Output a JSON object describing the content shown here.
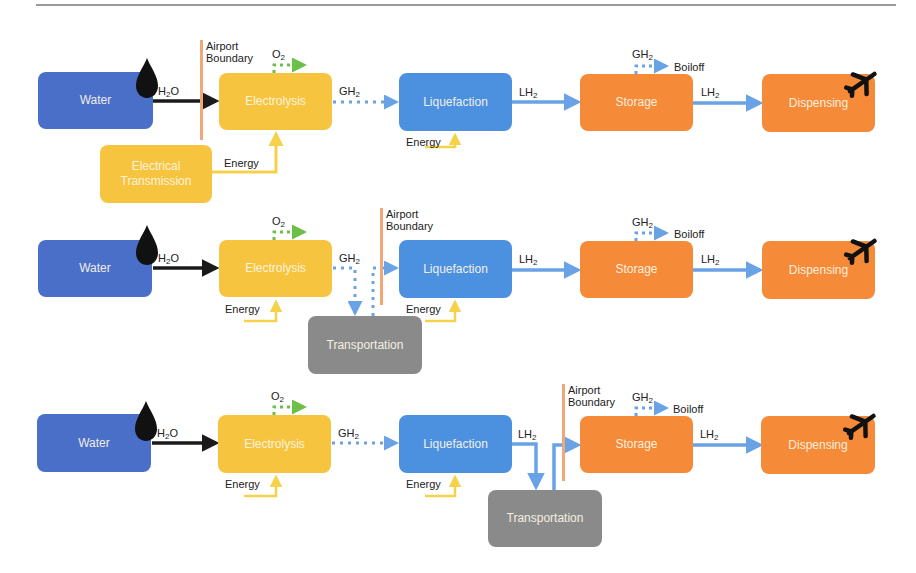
{
  "colors": {
    "water": "#4a6fc9",
    "electrolysis": "#f6c43e",
    "electrical_transmission": "#f6c43e",
    "liquefaction": "#4c90e0",
    "storage": "#f58a38",
    "dispensing": "#f58a38",
    "transportation": "#8a8a8a",
    "boundary": "#f0a878",
    "flow_h2": "#6aa2e6",
    "flow_o2": "#6cc04a",
    "flow_energy": "#f6d24a",
    "flow_water": "#1a1a1a"
  },
  "labels": {
    "airport": "Airport",
    "boundary": "Boundary",
    "energy": "Energy",
    "boiloff": "Boiloff",
    "h2o_main": "H",
    "h2o_sub": "2",
    "h2o_tail": "O",
    "o2_main": "O",
    "o2_sub": "2",
    "gh2_main": "GH",
    "gh2_sub": "2",
    "lh2_main": "LH",
    "lh2_sub": "2"
  },
  "rows": [
    {
      "id": "row1",
      "scenario": "On-site electrolysis at airport",
      "nodes": {
        "water": "Water",
        "electrolysis": "Electrolysis",
        "electrical_transmission_1": "Electrical",
        "electrical_transmission_2": "Transmission",
        "liquefaction": "Liquefaction",
        "storage": "Storage",
        "dispensing": "Dispensing"
      }
    },
    {
      "id": "row2",
      "scenario": "Off-site electrolysis, GH2 transported to airport",
      "nodes": {
        "water": "Water",
        "electrolysis": "Electrolysis",
        "transportation": "Transportation",
        "liquefaction": "Liquefaction",
        "storage": "Storage",
        "dispensing": "Dispensing"
      }
    },
    {
      "id": "row3",
      "scenario": "Off-site liquefaction, LH2 transported to airport",
      "nodes": {
        "water": "Water",
        "electrolysis": "Electrolysis",
        "liquefaction": "Liquefaction",
        "transportation": "Transportation",
        "storage": "Storage",
        "dispensing": "Dispensing"
      }
    }
  ],
  "icons": {
    "water_drop": "water-drop-icon",
    "airplane": "airplane-icon"
  }
}
